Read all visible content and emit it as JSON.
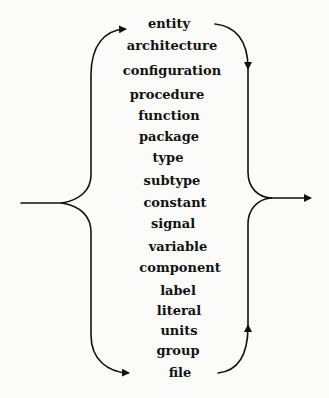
{
  "diagram": {
    "type": "syntax-diagram",
    "stroke_color": "#111111",
    "background": "#fbfbf9",
    "keywords": [
      {
        "label": "entity",
        "cx": 169,
        "top": 17
      },
      {
        "label": "architecture",
        "cx": 172,
        "top": 39
      },
      {
        "label": "configuration",
        "cx": 172,
        "top": 64
      },
      {
        "label": "procedure",
        "cx": 167,
        "top": 88
      },
      {
        "label": "function",
        "cx": 169,
        "top": 109
      },
      {
        "label": "package",
        "cx": 169,
        "top": 130
      },
      {
        "label": "type",
        "cx": 168,
        "top": 151
      },
      {
        "label": "subtype",
        "cx": 172,
        "top": 174
      },
      {
        "label": "constant",
        "cx": 175,
        "top": 196
      },
      {
        "label": "signal",
        "cx": 173,
        "top": 217
      },
      {
        "label": "variable",
        "cx": 178,
        "top": 240
      },
      {
        "label": "component",
        "cx": 180,
        "top": 261
      },
      {
        "label": "label",
        "cx": 178,
        "top": 284
      },
      {
        "label": "literal",
        "cx": 179,
        "top": 304
      },
      {
        "label": "units",
        "cx": 179,
        "top": 324
      },
      {
        "label": "group",
        "cx": 178,
        "top": 344
      },
      {
        "label": "file",
        "cx": 180,
        "top": 366
      }
    ],
    "flow": {
      "entry": "left",
      "exit": "right",
      "top_loop_arrows": [
        "right-into-entity",
        "down-from-entity"
      ],
      "bottom_loop_arrows": [
        "right-into-file",
        "up-from-file"
      ]
    }
  }
}
